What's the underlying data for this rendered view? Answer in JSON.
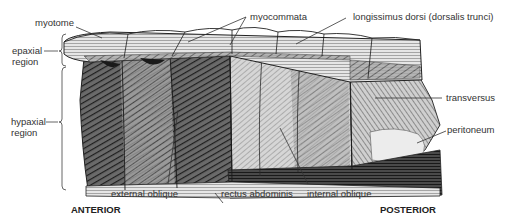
{
  "diagram": {
    "type": "anatomical-illustration",
    "labels": {
      "myotome": "myotome",
      "myocommata": "myocommata",
      "longissimus": "longissimus dorsi (dorsalis trunci)",
      "epaxial_line1": "epaxial",
      "epaxial_line2": "region",
      "hypaxial_line1": "hypaxial",
      "hypaxial_line2": "region",
      "transversus": "transversus",
      "peritoneum": "peritoneum",
      "external_oblique": "external oblique",
      "rectus_abdominis": "rectus abdominis",
      "internal_oblique": "internal oblique"
    },
    "orientation": {
      "anterior": "ANTERIOR",
      "posterior": "POSTERIOR"
    },
    "colors": {
      "ink": "#2a2a2a",
      "dark_shade": "#3a3a3a",
      "mid_shade": "#8a8a8a",
      "light_shade": "#d8d8d8",
      "background": "#ffffff"
    }
  }
}
